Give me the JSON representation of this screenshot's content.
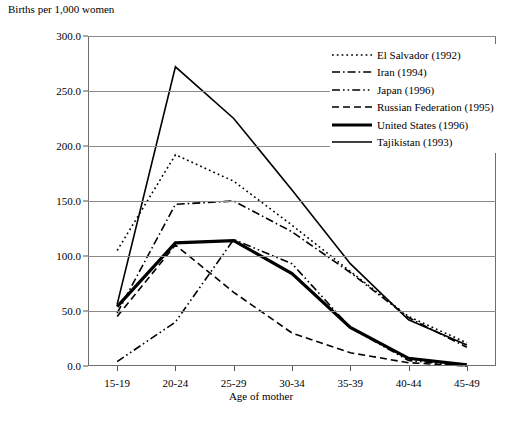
{
  "chart_data": {
    "type": "line",
    "title": "",
    "ylabel": "Births per 1,000 women",
    "xlabel": "Age of mother",
    "categories": [
      "15-19",
      "20-24",
      "25-29",
      "30-34",
      "35-39",
      "40-44",
      "45-49"
    ],
    "ylim": [
      0,
      300
    ],
    "ytick_labels": [
      "0.0",
      "50.0",
      "100.0",
      "150.0",
      "200.0",
      "250.0",
      "300.0"
    ],
    "ytick_values": [
      0,
      50,
      100,
      150,
      200,
      250,
      300
    ],
    "grid": "horizontal",
    "legend_position": "top-right",
    "series": [
      {
        "name": "El Salvador (1992)",
        "style": "dotted",
        "width": 1.6,
        "values": [
          105,
          192,
          168,
          128,
          86,
          45,
          21
        ]
      },
      {
        "name": "Iran (1994)",
        "style": "dash-dot",
        "width": 1.6,
        "values": [
          48,
          147,
          150,
          122,
          85,
          44,
          17
        ]
      },
      {
        "name": "Japan (1996)",
        "style": "dash-dot-dot",
        "width": 1.6,
        "values": [
          4,
          40,
          115,
          93,
          35,
          5,
          0
        ]
      },
      {
        "name": "Russian Federation (1995)",
        "style": "dashed",
        "width": 1.6,
        "values": [
          45,
          110,
          67,
          30,
          12,
          3,
          0
        ]
      },
      {
        "name": "United States (1996)",
        "style": "solid",
        "width": 3.2,
        "values": [
          54,
          112,
          114,
          84,
          35,
          7,
          1
        ]
      },
      {
        "name": "Tajikistan (1993)",
        "style": "solid",
        "width": 1.6,
        "values": [
          56,
          272,
          225,
          160,
          93,
          42,
          19
        ]
      }
    ]
  }
}
